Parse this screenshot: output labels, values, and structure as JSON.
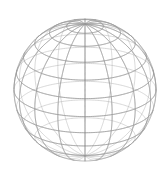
{
  "figure": {
    "type": "wireframe-sphere",
    "background_color": "#ffffff",
    "line_color": "#9a9a9a",
    "line_width": 0.7,
    "canvas": {
      "width": 168,
      "height": 171
    }
  },
  "chart_data": {
    "type": "wireframe-sphere",
    "subtitle": "",
    "xlabel": "",
    "ylabel": "",
    "projection": "orthographic",
    "grid": true,
    "legend": null,
    "sphere": {
      "center_x": 85,
      "center_y": 90,
      "radius": 71,
      "pole_screen_x": 85,
      "pole_screen_y": 19,
      "camera_elevation_deg": 22,
      "camera_rotation_deg": 0,
      "bottom_clip_y": 163
    },
    "meridians": {
      "count": 16,
      "longitudes_deg": [
        0,
        22.5,
        45,
        67.5,
        90,
        112.5,
        135,
        157.5,
        180,
        202.5,
        225,
        247.5,
        270,
        292.5,
        315,
        337.5
      ],
      "visible_front_count": 9
    },
    "parallels": {
      "count": 7,
      "latitudes_deg": [
        75,
        60,
        45,
        30,
        15,
        0,
        -15,
        -30,
        -45
      ],
      "equator_latitude_deg": 0
    },
    "silhouette": {
      "visible": true,
      "shape": "circle-truncated-bottom"
    },
    "colors": {
      "stroke": "#9a9a9a",
      "background": "#ffffff"
    }
  }
}
